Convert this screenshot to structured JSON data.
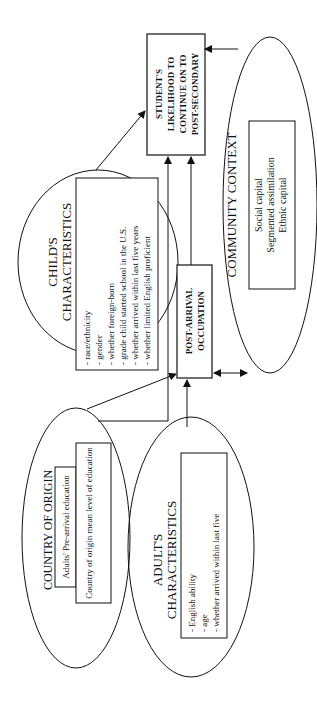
{
  "diagram": {
    "outcome": {
      "lines": [
        "STUDENT'S",
        "LIKELIHOOD TO",
        "CONTINUE ON TO",
        "POST-SECONDARY"
      ]
    },
    "community_context": {
      "title": "COMMUNITY CONTEXT",
      "items": [
        "Social capital",
        "Segmented assimilation",
        "Ethnic capital"
      ]
    },
    "childs_characteristics": {
      "title_lines": [
        "CHILD'S",
        "CHARACTERISTICS"
      ],
      "items": [
        "- race/ethnicity",
        "- gender",
        "- whether foreign-born",
        "- grade child started school in the U.S.",
        "- whether arrived within last five years",
        "- whether limited English proficient"
      ]
    },
    "post_arrival_occupation": {
      "lines": [
        "POST-ARRIVAL",
        "OCCUPATION"
      ]
    },
    "country_of_origin": {
      "title": "COUNTRY OF ORIGIN",
      "items": [
        "Adults' Pre-arrival education",
        "Country of origin mean level of education"
      ]
    },
    "adults_characteristics": {
      "title_lines": [
        "ADULT'S",
        "CHARACTERISTICS"
      ],
      "items": [
        "- English ability",
        "- age",
        "- whether arrived within last five"
      ]
    },
    "colors": {
      "stroke": "#111111",
      "background": "#ffffff"
    }
  }
}
